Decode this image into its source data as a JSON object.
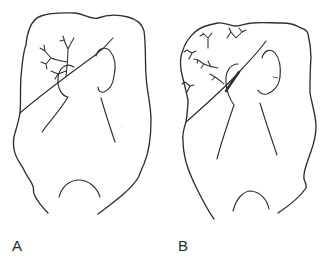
{
  "figure": {
    "background_color": "#ffffff",
    "stroke_color": "#2f2f2f",
    "label_color": "#2b2b2b",
    "panels": [
      {
        "id": "A",
        "label": "A",
        "branch_clusters": 1
      },
      {
        "id": "B",
        "label": "B",
        "branch_clusters": 6
      }
    ]
  }
}
